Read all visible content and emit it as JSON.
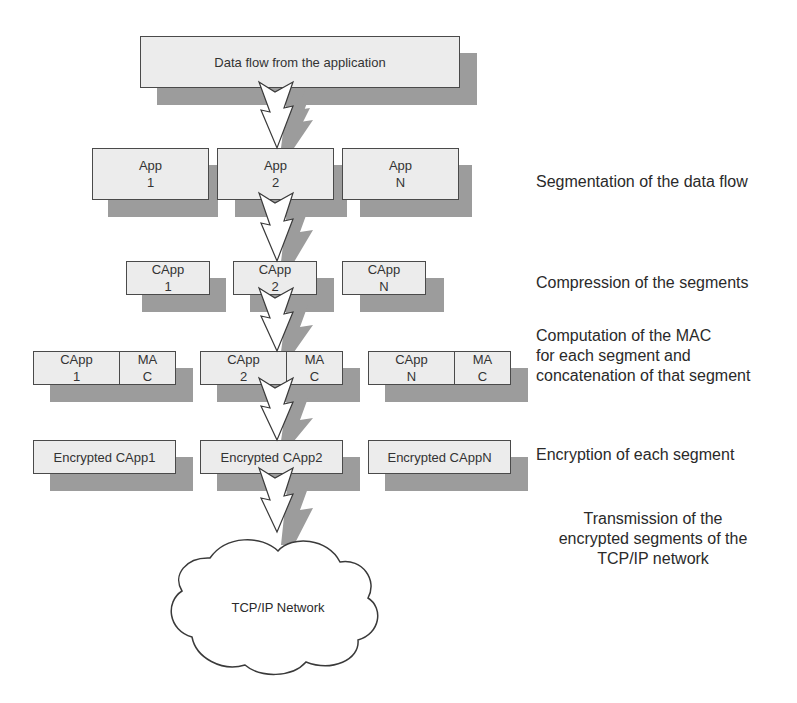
{
  "diagram": {
    "top_box": {
      "label": "Data flow from the application"
    },
    "segments": [
      {
        "label": "App\n1"
      },
      {
        "label": "App\n2"
      },
      {
        "label": "App\nN"
      }
    ],
    "compressed": [
      {
        "label": "CApp\n1"
      },
      {
        "label": "CApp\n2"
      },
      {
        "label": "CApp\nN"
      }
    ],
    "mac_segments": [
      {
        "data": "CApp\n1",
        "mac": "MA\nC"
      },
      {
        "data": "CApp\n2",
        "mac": "MA\nC"
      },
      {
        "data": "CApp\nN",
        "mac": "MA\nC"
      }
    ],
    "encrypted": [
      {
        "label": "Encrypted CApp1"
      },
      {
        "label": "Encrypted CApp2"
      },
      {
        "label": "Encrypted CAppN"
      }
    ],
    "network": {
      "label": "TCP/IP Network"
    },
    "steps": [
      {
        "label": "Segmentation of the data flow"
      },
      {
        "label": "Compression of the segments"
      },
      {
        "label": "Computation of the MAC\nfor each segment and\nconcatenation of that segment"
      },
      {
        "label": "Encryption of each segment"
      },
      {
        "label": "Transmission of the\nencrypted segments of the\nTCP/IP network"
      }
    ],
    "colors": {
      "box_fill": "#ececec",
      "shadow": "#9c9c9c",
      "stroke": "#4a4a4a"
    }
  }
}
